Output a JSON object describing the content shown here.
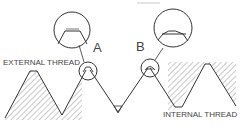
{
  "diagram": {
    "type": "thread-profile",
    "labels": {
      "external": "EXTERNAL THREAD",
      "internal": "INTERNAL THREAD",
      "detail_a": "A",
      "detail_b": "B"
    },
    "colors": {
      "line": "#333333",
      "hatch": "#777777",
      "background": "#ffffff"
    }
  }
}
